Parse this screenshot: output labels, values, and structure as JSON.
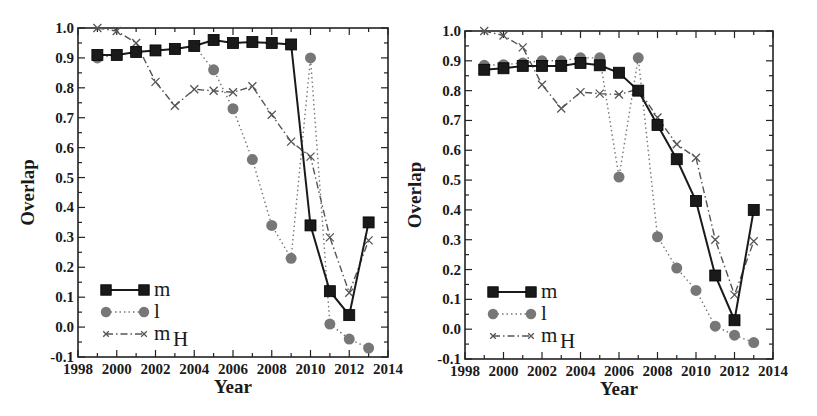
{
  "chart_data": [
    {
      "type": "line",
      "panel": "left",
      "title": "",
      "xlabel": "Year",
      "ylabel": "Overlap",
      "xlim": [
        1998,
        2014
      ],
      "ylim": [
        -0.1,
        1.0
      ],
      "xticks": [
        1998,
        2000,
        2002,
        2004,
        2006,
        2008,
        2010,
        2012,
        2014
      ],
      "yticks": [
        -0.1,
        0.0,
        0.1,
        0.2,
        0.3,
        0.4,
        0.5,
        0.6,
        0.7,
        0.8,
        0.9,
        1.0
      ],
      "grid": false,
      "legend_position": "lower left",
      "x": [
        1999,
        2000,
        2001,
        2002,
        2003,
        2004,
        2005,
        2006,
        2007,
        2008,
        2009,
        2010,
        2011,
        2012,
        2013
      ],
      "series": [
        {
          "name": "m",
          "style": "solid",
          "marker": "square",
          "color": "#1a1a1a",
          "values": [
            0.91,
            0.91,
            0.92,
            0.925,
            0.93,
            0.94,
            0.96,
            0.95,
            0.953,
            0.95,
            0.945,
            0.34,
            0.12,
            0.04,
            0.35
          ]
        },
        {
          "name": "l",
          "style": "dotted",
          "marker": "circle",
          "color": "#777777",
          "values": [
            0.9,
            0.91,
            0.92,
            0.925,
            0.93,
            0.94,
            0.86,
            0.73,
            0.56,
            0.34,
            0.23,
            0.9,
            0.01,
            -0.04,
            -0.07
          ]
        },
        {
          "name": "m_H",
          "style": "dashdot",
          "marker": "x",
          "color": "#555555",
          "values": [
            1.0,
            0.99,
            0.95,
            0.82,
            0.74,
            0.795,
            0.79,
            0.785,
            0.805,
            0.71,
            0.62,
            0.57,
            0.3,
            0.115,
            0.29
          ]
        }
      ]
    },
    {
      "type": "line",
      "panel": "right",
      "title": "",
      "xlabel": "Year",
      "ylabel": "Overlap",
      "xlim": [
        1998,
        2014
      ],
      "ylim": [
        -0.1,
        1.0
      ],
      "xticks": [
        1998,
        2000,
        2002,
        2004,
        2006,
        2008,
        2010,
        2012,
        2014
      ],
      "yticks": [
        -0.1,
        0.0,
        0.1,
        0.2,
        0.3,
        0.4,
        0.5,
        0.6,
        0.7,
        0.8,
        0.9,
        1.0
      ],
      "grid": false,
      "legend_position": "lower left",
      "x": [
        1999,
        2000,
        2001,
        2002,
        2003,
        2004,
        2005,
        2006,
        2007,
        2008,
        2009,
        2010,
        2011,
        2012,
        2013
      ],
      "series": [
        {
          "name": "m",
          "style": "solid",
          "marker": "square",
          "color": "#1a1a1a",
          "values": [
            0.87,
            0.875,
            0.883,
            0.883,
            0.883,
            0.893,
            0.885,
            0.86,
            0.8,
            0.685,
            0.57,
            0.43,
            0.18,
            0.03,
            0.4
          ]
        },
        {
          "name": "l",
          "style": "dotted",
          "marker": "circle",
          "color": "#777777",
          "values": [
            0.885,
            0.887,
            0.893,
            0.9,
            0.9,
            0.91,
            0.91,
            0.51,
            0.91,
            0.31,
            0.205,
            0.13,
            0.01,
            -0.02,
            -0.045
          ]
        },
        {
          "name": "m_H",
          "style": "dashdot",
          "marker": "x",
          "color": "#555555",
          "values": [
            1.0,
            0.985,
            0.945,
            0.82,
            0.74,
            0.795,
            0.79,
            0.787,
            0.805,
            0.71,
            0.62,
            0.575,
            0.3,
            0.115,
            0.295
          ]
        }
      ]
    }
  ],
  "panels": [
    {
      "xlabel": "Year",
      "ylabel": "Overlap",
      "xtick_labels": [
        "1998",
        "2000",
        "2002",
        "2004",
        "2006",
        "2008",
        "2010",
        "2012",
        "2014"
      ],
      "ytick_labels": [
        "-0.1",
        "0.0",
        "0.1",
        "0.2",
        "0.3",
        "0.4",
        "0.5",
        "0.6",
        "0.7",
        "0.8",
        "0.9",
        "1.0"
      ],
      "legend": [
        {
          "label": "m",
          "sub": ""
        },
        {
          "label": "l",
          "sub": ""
        },
        {
          "label": "m",
          "sub": "H"
        }
      ]
    },
    {
      "xlabel": "Year",
      "ylabel": "Overlap",
      "xtick_labels": [
        "1998",
        "2000",
        "2002",
        "2004",
        "2006",
        "2008",
        "2010",
        "2012",
        "2014"
      ],
      "ytick_labels": [
        "-0.1",
        "0.0",
        "0.1",
        "0.2",
        "0.3",
        "0.4",
        "0.5",
        "0.6",
        "0.7",
        "0.8",
        "0.9",
        "1.0"
      ],
      "legend": [
        {
          "label": "m",
          "sub": ""
        },
        {
          "label": "l",
          "sub": ""
        },
        {
          "label": "m",
          "sub": "H"
        }
      ]
    }
  ]
}
